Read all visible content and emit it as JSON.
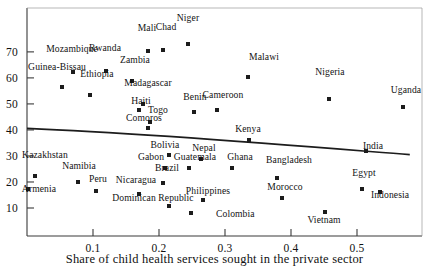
{
  "chart_data": {
    "type": "scatter",
    "title": "",
    "xlabel": "Share of child health services sought in the private sector",
    "ylabel": "",
    "xlim": [
      0.0,
      0.58
    ],
    "ylim": [
      4,
      78
    ],
    "xticks": [
      "0.1",
      "0.2",
      "0.3",
      "0.4",
      "0.5"
    ],
    "xtick_values": [
      0.1,
      0.2,
      0.3,
      0.4,
      0.5
    ],
    "yticks": [
      "10",
      "20",
      "30",
      "40",
      "50",
      "60",
      "70"
    ],
    "ytick_values": [
      10,
      20,
      30,
      40,
      50,
      60,
      70
    ],
    "grid": false,
    "legend": "none",
    "points": [
      {
        "name": "Niger",
        "x": 0.244,
        "y": 73.0,
        "lx": 188,
        "ly": 13,
        "la": "center"
      },
      {
        "name": "Mali",
        "x": 0.183,
        "y": 70.5,
        "lx": 147,
        "ly": 23,
        "la": "center"
      },
      {
        "name": "Chad",
        "x": 0.206,
        "y": 70.8,
        "lx": 166,
        "ly": 22,
        "la": "center"
      },
      {
        "name": "Rwanda",
        "x": 0.12,
        "y": 62.6,
        "lx": 105,
        "ly": 43,
        "la": "center"
      },
      {
        "name": "Mozambique",
        "x": 0.07,
        "y": 62.4,
        "lx": 72,
        "ly": 44,
        "la": "center"
      },
      {
        "name": "Zambia",
        "x": 0.159,
        "y": 58.8,
        "lx": 135,
        "ly": 55,
        "la": "center"
      },
      {
        "name": "Guinea-Bissau",
        "x": 0.053,
        "y": 56.6,
        "lx": 57,
        "ly": 62,
        "la": "center"
      },
      {
        "name": "Ethiopia",
        "x": 0.095,
        "y": 53.3,
        "lx": 97,
        "ly": 69,
        "la": "center"
      },
      {
        "name": "Madagascar",
        "x": 0.175,
        "y": 49.8,
        "lx": 148,
        "ly": 78,
        "la": "center"
      },
      {
        "name": "Benin",
        "x": 0.253,
        "y": 47.0,
        "lx": 195,
        "ly": 92,
        "la": "center"
      },
      {
        "name": "Cameroon",
        "x": 0.288,
        "y": 47.7,
        "lx": 223,
        "ly": 90,
        "la": "center"
      },
      {
        "name": "Malawi",
        "x": 0.335,
        "y": 60.4,
        "lx": 264,
        "ly": 52,
        "la": "center"
      },
      {
        "name": "Nigeria",
        "x": 0.458,
        "y": 51.8,
        "lx": 330,
        "ly": 67,
        "la": "center"
      },
      {
        "name": "Uganda",
        "x": 0.57,
        "y": 48.8,
        "lx": 406,
        "ly": 85,
        "la": "center"
      },
      {
        "name": "Haiti",
        "x": 0.169,
        "y": 47.8,
        "lx": 141,
        "ly": 96,
        "la": "center"
      },
      {
        "name": "Togo",
        "x": 0.186,
        "y": 43.2,
        "lx": 158,
        "ly": 105,
        "la": "center"
      },
      {
        "name": "Comoros",
        "x": 0.183,
        "y": 40.8,
        "lx": 144,
        "ly": 113,
        "la": "center"
      },
      {
        "name": "Kenya",
        "x": 0.336,
        "y": 36.2,
        "lx": 248,
        "ly": 124,
        "la": "center"
      },
      {
        "name": "India",
        "x": 0.514,
        "y": 32.0,
        "lx": 373,
        "ly": 141,
        "la": "center"
      },
      {
        "name": "Kazakhstan",
        "x": 0.012,
        "y": 22.4,
        "lx": 45,
        "ly": 150,
        "la": "center"
      },
      {
        "name": "Namibia",
        "x": 0.077,
        "y": 19.9,
        "lx": 79,
        "ly": 161,
        "la": "center"
      },
      {
        "name": "Armenia",
        "x": 0.002,
        "y": 17.3,
        "lx": 39,
        "ly": 184,
        "la": "center"
      },
      {
        "name": "Peru",
        "x": 0.104,
        "y": 16.6,
        "lx": 98,
        "ly": 174,
        "la": "center"
      },
      {
        "name": "Bolivia",
        "x": 0.215,
        "y": 30.5,
        "lx": 165,
        "ly": 140,
        "la": "center"
      },
      {
        "name": "Gabon",
        "x": 0.209,
        "y": 25.3,
        "lx": 151,
        "ly": 152,
        "la": "center"
      },
      {
        "name": "Guatemala",
        "x": 0.246,
        "y": 25.2,
        "lx": 195,
        "ly": 152,
        "la": "center"
      },
      {
        "name": "Nepal",
        "x": 0.264,
        "y": 28.8,
        "lx": 204,
        "ly": 143,
        "la": "center"
      },
      {
        "name": "Brazil",
        "x": 0.206,
        "y": 19.8,
        "lx": 167,
        "ly": 163,
        "la": "center"
      },
      {
        "name": "Nicaragua",
        "x": 0.17,
        "y": 15.2,
        "lx": 136,
        "ly": 175,
        "la": "center"
      },
      {
        "name": "Dominican Republic",
        "x": 0.215,
        "y": 10.6,
        "lx": 153,
        "ly": 193,
        "la": "center"
      },
      {
        "name": "Philippines",
        "x": 0.267,
        "y": 13.0,
        "lx": 208,
        "ly": 186,
        "la": "center"
      },
      {
        "name": "Colombia",
        "x": 0.249,
        "y": 8.1,
        "lx": 216,
        "ly": 209,
        "la": "left"
      },
      {
        "name": "Ghana",
        "x": 0.31,
        "y": 25.4,
        "lx": 240,
        "ly": 152,
        "la": "center"
      },
      {
        "name": "Bangladesh",
        "x": 0.379,
        "y": 21.6,
        "lx": 289,
        "ly": 155,
        "la": "center"
      },
      {
        "name": "Morocco",
        "x": 0.386,
        "y": 13.7,
        "lx": 285,
        "ly": 182,
        "la": "center"
      },
      {
        "name": "Egypt",
        "x": 0.508,
        "y": 17.2,
        "lx": 364,
        "ly": 168,
        "la": "center"
      },
      {
        "name": "Indonesia",
        "x": 0.535,
        "y": 16.1,
        "lx": 390,
        "ly": 190,
        "la": "center"
      },
      {
        "name": "Vietnam",
        "x": 0.452,
        "y": 8.3,
        "lx": 324,
        "ly": 215,
        "la": "center"
      }
    ],
    "trendline": {
      "x_start": 0.0,
      "y_start": 40.6,
      "x_end": 0.58,
      "y_end": 30.5,
      "description": "downward-sloping fitted curve"
    },
    "axes_geometry": {
      "left_px": 27,
      "right_px": 422,
      "bottom_px": 236,
      "top_px": 8,
      "x0_px": 27,
      "x_px_per_unit": 660,
      "y10_px": 208,
      "y_px_per_unit": 2.602
    }
  }
}
